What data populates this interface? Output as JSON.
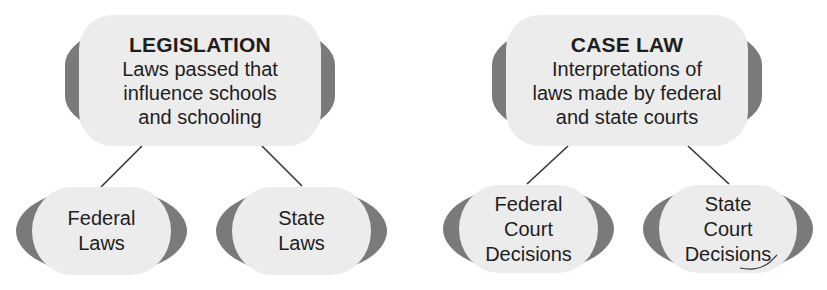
{
  "diagram": {
    "colors": {
      "box_fill": "#ececec",
      "box_edge": "#7a7a7a",
      "text": "#1e1e1e",
      "connector": "#333333",
      "background": "#ffffff"
    },
    "branches": [
      {
        "title": "LEGISLATION",
        "description": [
          "Laws passed that",
          "influence schools",
          "and schooling"
        ],
        "children": [
          {
            "label": [
              "Federal",
              "Laws"
            ]
          },
          {
            "label": [
              "State",
              "Laws"
            ]
          }
        ]
      },
      {
        "title": "CASE LAW",
        "description": [
          "Interpretations of",
          "laws made by federal",
          "and state courts"
        ],
        "children": [
          {
            "label": [
              "Federal",
              "Court",
              "Decisions"
            ]
          },
          {
            "label": [
              "State",
              "Court",
              "Decisions"
            ]
          }
        ]
      }
    ]
  }
}
